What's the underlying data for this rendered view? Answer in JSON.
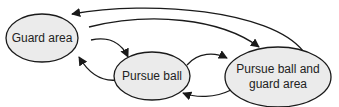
{
  "diagram": {
    "type": "state-transition",
    "colors": {
      "node_fill": "#ebebeb",
      "stroke": "#1a1a1a",
      "text": "#222222",
      "background": "#ffffff"
    },
    "nodes": [
      {
        "id": "guard",
        "label_lines": [
          "Guard area"
        ]
      },
      {
        "id": "pursue",
        "label_lines": [
          "Pursue ball"
        ]
      },
      {
        "id": "both",
        "label_lines": [
          "Pursue ball and",
          "guard area"
        ]
      }
    ],
    "edges": [
      {
        "from": "both",
        "to": "guard"
      },
      {
        "from": "guard",
        "to": "both"
      },
      {
        "from": "guard",
        "to": "pursue"
      },
      {
        "from": "pursue",
        "to": "guard"
      },
      {
        "from": "pursue",
        "to": "both"
      },
      {
        "from": "both",
        "to": "pursue"
      }
    ]
  }
}
